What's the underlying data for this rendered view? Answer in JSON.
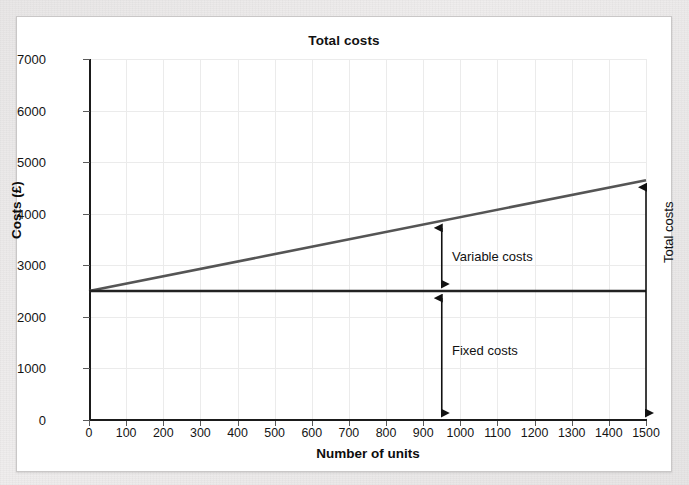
{
  "chart_data": {
    "type": "line",
    "title": "Total costs",
    "xlabel": "Number of units",
    "ylabel": "Costs (£)",
    "xlim": [
      0,
      1500
    ],
    "ylim": [
      0,
      7000
    ],
    "grid": true,
    "legend": "none",
    "x_ticks": [
      0,
      100,
      200,
      300,
      400,
      500,
      600,
      700,
      800,
      900,
      1000,
      1100,
      1200,
      1300,
      1400,
      1500
    ],
    "x_tick_labels": [
      "0",
      "100",
      "200",
      "300",
      "400",
      "500",
      "600",
      "700",
      "800",
      "900",
      "1000",
      "1100",
      "1200",
      "1300",
      "1400",
      "1500"
    ],
    "y_ticks": [
      0,
      1000,
      2000,
      3000,
      4000,
      5000,
      6000,
      7000
    ],
    "y_tick_labels": [
      "0",
      "1000",
      "2000",
      "3000",
      "4000",
      "5000",
      "6000",
      "7000"
    ],
    "series": [
      {
        "name": "Total costs",
        "color": "#555555",
        "x": [
          0,
          1500
        ],
        "values": [
          2500,
          4650
        ]
      },
      {
        "name": "Fixed costs",
        "color": "#222222",
        "x": [
          0,
          1500
        ],
        "values": [
          2500,
          2500
        ]
      }
    ],
    "annotations": [
      {
        "label": "Variable costs",
        "at_x": 950,
        "from_y": 2500,
        "to_y": 3860,
        "arrow": "double"
      },
      {
        "label": "Fixed costs",
        "at_x": 950,
        "from_y": 0,
        "to_y": 2500,
        "arrow": "double"
      },
      {
        "label": "Total costs",
        "at_x": 1500,
        "from_y": 0,
        "to_y": 4650,
        "arrow": "double",
        "orientation": "vertical-text"
      }
    ]
  },
  "figure": {
    "title": "Total costs",
    "x_axis_label": "Number of units",
    "y_axis_label": "Costs (£)",
    "annotation_variable": "Variable costs",
    "annotation_fixed": "Fixed costs",
    "annotation_total": "Total costs"
  },
  "colors": {
    "total_cost_line": "#555555",
    "fixed_cost_line": "#222222",
    "axis": "#1b1b1b",
    "grid": "#ebebeb",
    "card_background": "#ffffff",
    "page_background": "#eceaea"
  }
}
